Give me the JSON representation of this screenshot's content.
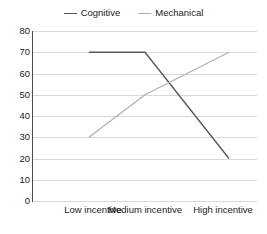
{
  "chart_data": {
    "type": "line",
    "title": "",
    "xlabel": "",
    "ylabel": "",
    "categories": [
      "Low incentive",
      "Medium incentive",
      "High incentive"
    ],
    "ylim": [
      0,
      80
    ],
    "yticks": [
      0,
      10,
      20,
      30,
      40,
      50,
      60,
      70,
      80
    ],
    "ytick_labels": [
      "0",
      "10",
      "20",
      "30",
      "40",
      "50",
      "60",
      "70",
      "80"
    ],
    "grid": "horizontal",
    "legend_position": "top-center",
    "series": [
      {
        "name": "Cognitive",
        "values": [
          70,
          70,
          20
        ],
        "color": "#595959"
      },
      {
        "name": "Mechanical",
        "values": [
          30,
          50,
          70
        ],
        "color": "#b3b3b3"
      }
    ],
    "annotations": []
  },
  "legend": {
    "items": [
      {
        "label": "Cognitive",
        "color": "#595959"
      },
      {
        "label": "Mechanical",
        "color": "#b3b3b3"
      }
    ]
  },
  "axes": {
    "y_axis_color": "#4d4d4d",
    "x_axis_color": "#4d4d4d",
    "gridline_color": "#d9d9d9"
  }
}
